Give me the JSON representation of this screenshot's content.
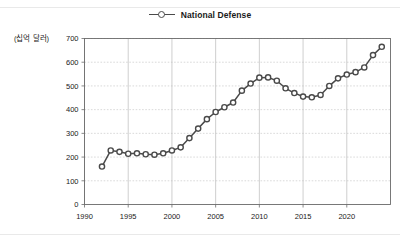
{
  "legend": {
    "entries": [
      {
        "label": "National Defense",
        "color": "#4a4a4a",
        "marker": "open-circle"
      }
    ]
  },
  "axes": {
    "y_unit_label": "(십억 달러)",
    "y_ticks": [
      "0",
      "100",
      "200",
      "300",
      "400",
      "500",
      "600",
      "700"
    ],
    "x_ticks": [
      "1990",
      "1995",
      "2000",
      "2005",
      "2010",
      "2015",
      "2020"
    ]
  },
  "chart_data": {
    "type": "line",
    "title": "",
    "subtitle": "",
    "xlabel": "",
    "ylabel": "(십억 달러)",
    "xlim": [
      1990,
      2025
    ],
    "ylim": [
      0,
      700
    ],
    "grid": true,
    "legend_position": "top-center",
    "x_tick_values": [
      1990,
      1995,
      2000,
      2005,
      2010,
      2015,
      2020
    ],
    "y_tick_values": [
      0,
      100,
      200,
      300,
      400,
      500,
      600,
      700
    ],
    "x": [
      1992,
      1993,
      1994,
      1995,
      1996,
      1997,
      1998,
      1999,
      2000,
      2001,
      2002,
      2003,
      2004,
      2005,
      2006,
      2007,
      2008,
      2009,
      2010,
      2011,
      2012,
      2013,
      2014,
      2015,
      2016,
      2017,
      2018,
      2019,
      2020,
      2021,
      2022,
      2023,
      2024
    ],
    "series": [
      {
        "name": "National Defense",
        "color": "#4a4a4a",
        "marker": "open-circle",
        "values": [
          160,
          228,
          222,
          214,
          216,
          212,
          210,
          216,
          228,
          241,
          280,
          320,
          360,
          390,
          410,
          430,
          480,
          510,
          535,
          536,
          522,
          490,
          470,
          455,
          452,
          462,
          500,
          532,
          548,
          558,
          578,
          630,
          665
        ]
      }
    ]
  }
}
